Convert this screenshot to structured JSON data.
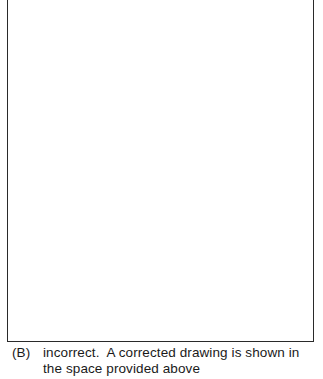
{
  "answer": {
    "label": "(B)",
    "line1": "incorrect.  A corrected drawing is shown in",
    "line2": "the space provided above"
  }
}
